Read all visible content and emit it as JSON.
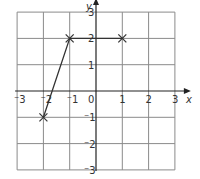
{
  "chart_data": {
    "type": "line",
    "title": "",
    "xlabel": "x",
    "ylabel": "y",
    "xlim": [
      -3,
      3
    ],
    "ylim": [
      -3,
      3
    ],
    "grid": true,
    "x_ticks": [
      "⁻3",
      "⁻2",
      "⁻1",
      "0",
      "1",
      "2",
      "3"
    ],
    "y_ticks": [
      "3",
      "2",
      "1",
      "⁻1",
      "⁻2",
      "⁻3"
    ],
    "series": [
      {
        "name": "path",
        "points": [
          [
            -2,
            -1
          ],
          [
            -1,
            2
          ],
          [
            1,
            2
          ]
        ],
        "marker": "x",
        "color": "#333333"
      }
    ]
  },
  "colors": {
    "grid": "#8a8a8a",
    "axis": "#222222",
    "line": "#333333"
  }
}
